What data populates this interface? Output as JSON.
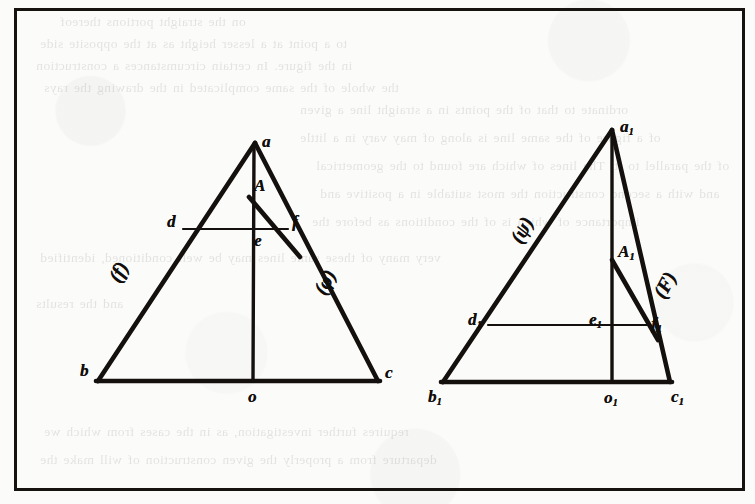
{
  "page": {
    "kind": "scanned-book-figure",
    "background_color": "#fbfbfa",
    "ink_color": "#14100e",
    "frame": {
      "color": "#16120f",
      "thickness_px": 3
    }
  },
  "ghost_text": {
    "description": "Faint mirrored text showing through from the reverse side of the printed page",
    "lines": [
      "on the straight portions thereof",
      "to a point at a lesser height as at the opposite side",
      "in the figure. In certain circumstances a construction",
      "the whole of the same complicated in the drawing the rays",
      "ordinate to that of the points in a straight line a given",
      "of a figure of the same line is along of may vary in a little",
      "of the parallel to it. The lines of which are found to the geometrical",
      "and with a second construction the most suitable in a positive and",
      "importance of which is of the conditions as before the",
      "very many of these same lines may be well conditioned, identified",
      "and the results",
      "requires further investigation, as in the cases from which we",
      "departure from a properly the given construction of will make the"
    ]
  },
  "figure": {
    "title_visible": false,
    "diagrams": [
      {
        "id": "left-diagram",
        "name": "left-triangle-construction",
        "vertices": {
          "apex": {
            "label": "a",
            "x": 255,
            "y": 143
          },
          "base_left": {
            "label": "b",
            "x": 98,
            "y": 381
          },
          "base_right": {
            "label": "c",
            "x": 378,
            "y": 381
          },
          "foot": {
            "label": "o",
            "x": 253,
            "y": 381
          },
          "inner_apex": {
            "label": "A",
            "x": 249,
            "y": 197
          },
          "chord_left": {
            "label": "d",
            "x": 183,
            "y": 229
          },
          "chord_cross": {
            "label": "e",
            "x": 251,
            "y": 229
          },
          "chord_right": {
            "label": "f",
            "x": 284,
            "y": 229
          }
        },
        "curve_labels": [
          {
            "label": "(f)",
            "side": "left",
            "x": 118,
            "y": 272
          },
          {
            "label": "(φ)",
            "side": "right",
            "x": 322,
            "y": 282
          }
        ],
        "point_labels": [
          {
            "text": "a",
            "sub": "",
            "x": 262,
            "y": 133
          },
          {
            "text": "A",
            "sub": "",
            "x": 254,
            "y": 177
          },
          {
            "text": "d",
            "sub": "",
            "x": 167,
            "y": 213
          },
          {
            "text": "e",
            "sub": "",
            "x": 254,
            "y": 232
          },
          {
            "text": "f",
            "sub": "",
            "x": 292,
            "y": 213
          },
          {
            "text": "b",
            "sub": "",
            "x": 80,
            "y": 362
          },
          {
            "text": "c",
            "sub": "",
            "x": 385,
            "y": 364
          },
          {
            "text": "o",
            "sub": "",
            "x": 248,
            "y": 388
          }
        ]
      },
      {
        "id": "right-diagram",
        "name": "right-triangle-construction",
        "vertices": {
          "apex": {
            "label": "a₁",
            "x": 612,
            "y": 130
          },
          "base_left": {
            "label": "b₁",
            "x": 443,
            "y": 382
          },
          "base_right": {
            "label": "c₁",
            "x": 670,
            "y": 382
          },
          "foot": {
            "label": "o₁",
            "x": 612,
            "y": 382
          },
          "inner_apex": {
            "label": "A₁",
            "x": 612,
            "y": 260
          },
          "chord_left": {
            "label": "d₁",
            "x": 488,
            "y": 325
          },
          "chord_cross": {
            "label": "e₁",
            "x": 612,
            "y": 325
          },
          "chord_right": {
            "label": "f₁",
            "x": 645,
            "y": 325
          }
        },
        "curve_labels": [
          {
            "label": "(ψ)",
            "side": "left",
            "x": 518,
            "y": 230
          },
          {
            "label": "(F)",
            "side": "right",
            "x": 661,
            "y": 285
          }
        ],
        "point_labels": [
          {
            "text": "a",
            "sub": "1",
            "x": 620,
            "y": 118
          },
          {
            "text": "A",
            "sub": "1",
            "x": 618,
            "y": 243
          },
          {
            "text": "d",
            "sub": "1",
            "x": 468,
            "y": 311
          },
          {
            "text": "e",
            "sub": "1",
            "x": 589,
            "y": 311
          },
          {
            "text": "f",
            "sub": "1",
            "x": 651,
            "y": 315
          },
          {
            "text": "b",
            "sub": "1",
            "x": 428,
            "y": 388
          },
          {
            "text": "c",
            "sub": "1",
            "x": 671,
            "y": 388
          },
          {
            "text": "o",
            "sub": "1",
            "x": 604,
            "y": 389
          }
        ]
      }
    ]
  }
}
